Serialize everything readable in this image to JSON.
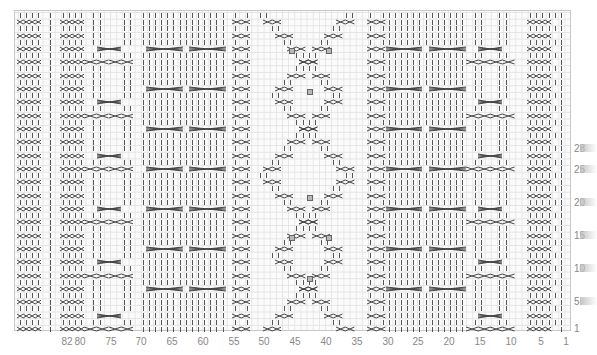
{
  "chart": {
    "type": "knitting-chart",
    "stitch_count_labeled": 82,
    "row_count_visible": 48,
    "colors": {
      "grid": "#e4e4e4",
      "border": "#c8c8c8",
      "symbol": "#444444",
      "bobble_fill": "#b8b8b8",
      "label": "#888888"
    },
    "column_labels": [
      {
        "text": "82",
        "x": 67
      },
      {
        "text": "80",
        "x": 80
      },
      {
        "text": "75",
        "x": 111
      },
      {
        "text": "70",
        "x": 141
      },
      {
        "text": "65",
        "x": 172
      },
      {
        "text": "60",
        "x": 203
      },
      {
        "text": "55",
        "x": 234
      },
      {
        "text": "50",
        "x": 264
      },
      {
        "text": "45",
        "x": 295
      },
      {
        "text": "40",
        "x": 326
      },
      {
        "text": "35",
        "x": 357
      },
      {
        "text": "30",
        "x": 388
      },
      {
        "text": "25",
        "x": 418
      },
      {
        "text": "20",
        "x": 449
      },
      {
        "text": "15",
        "x": 480
      },
      {
        "text": "10",
        "x": 511
      },
      {
        "text": "5",
        "x": 541
      },
      {
        "text": "1",
        "x": 566
      }
    ],
    "row_labels": [
      {
        "text": "28",
        "y": 148
      },
      {
        "text": "25",
        "y": 169
      },
      {
        "text": "20",
        "y": 202
      },
      {
        "text": "15",
        "y": 235
      },
      {
        "text": "10",
        "y": 268
      },
      {
        "text": "5",
        "y": 301
      },
      {
        "text": "1",
        "y": 328
      }
    ],
    "legend_symbols": {
      "knit": "vertical-bar",
      "cable_2x2": "double-cross",
      "cable_6x6": "wide-cross",
      "twisted_travel": "diagonal-cross",
      "bobble": "grey-square"
    },
    "bobbles": [
      {
        "x": 288,
        "y": 47
      },
      {
        "x": 325,
        "y": 47
      },
      {
        "x": 306,
        "y": 88
      },
      {
        "x": 306,
        "y": 194
      },
      {
        "x": 288,
        "y": 234
      },
      {
        "x": 325,
        "y": 234
      },
      {
        "x": 306,
        "y": 275
      }
    ]
  }
}
